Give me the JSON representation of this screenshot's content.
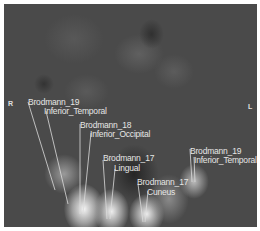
{
  "image": {
    "description": "Grayscale brain scan slice with labeled regions",
    "orientation": {
      "right": "R",
      "left": "L"
    },
    "labels": [
      {
        "area": "Brodmann_19",
        "region": "Inferior_Temporal",
        "side": "right"
      },
      {
        "area": "Brodmann_18",
        "region": "Inferior_Occipital"
      },
      {
        "area": "Brodmann_17",
        "region": "Lingual"
      },
      {
        "area": "Brodmann_17",
        "region": "Cuneus"
      },
      {
        "area": "Brodmann_19",
        "region": "Inferior_Temporal",
        "side": "left"
      }
    ],
    "colors": {
      "background": "#ffffff",
      "scan_base": "#4a4a4a",
      "label_text": "#e6e6e6",
      "leader_line": "#dcdcdc"
    }
  }
}
